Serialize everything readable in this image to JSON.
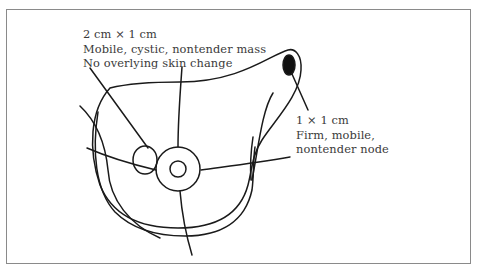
{
  "diagram": {
    "type": "anatomical-line-drawing",
    "colors": {
      "line": "#1a1a1a",
      "text": "#3a3a3a",
      "frame": "#8a8a8a",
      "node_fill": "#111111"
    },
    "annotations": {
      "mass": {
        "lines": [
          "2 cm × 1 cm",
          "Mobile, cystic, nontender mass",
          "No overlying skin change"
        ]
      },
      "node": {
        "lines": [
          "1 × 1 cm",
          "Firm, mobile,",
          "nontender node"
        ]
      }
    }
  }
}
